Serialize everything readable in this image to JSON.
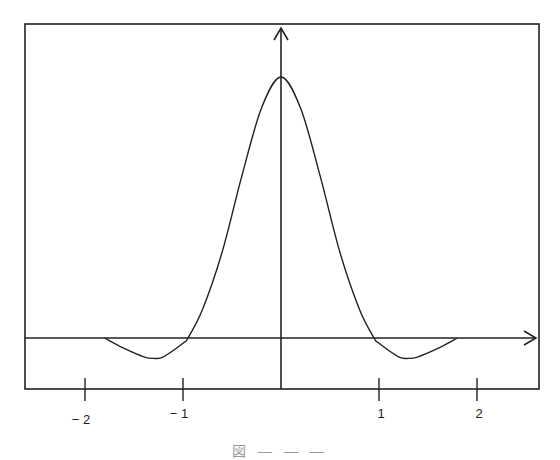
{
  "chart_data": {
    "type": "line",
    "title": "",
    "xlabel": "",
    "ylabel": "",
    "xlim": [
      -2.6,
      2.6
    ],
    "grid": false,
    "legend": null,
    "x_ticks": [
      -2,
      -1,
      1,
      2
    ],
    "x_tick_labels": [
      "− 2",
      "− 1",
      "1",
      "2"
    ],
    "series": [
      {
        "name": "curve",
        "x": [
          -1.8,
          -1.6,
          -1.4,
          -1.3,
          -1.2,
          -1.0,
          -0.95,
          -0.8,
          -0.6,
          -0.4,
          -0.2,
          0.0,
          0.2,
          0.4,
          0.6,
          0.8,
          0.95,
          1.0,
          1.2,
          1.3,
          1.4,
          1.6,
          1.8
        ],
        "y": [
          0.0,
          -0.04,
          -0.072,
          -0.078,
          -0.072,
          -0.02,
          0.0,
          0.11,
          0.33,
          0.62,
          0.88,
          1.0,
          0.88,
          0.62,
          0.33,
          0.11,
          0.0,
          -0.02,
          -0.072,
          -0.078,
          -0.072,
          -0.04,
          0.0
        ]
      }
    ]
  },
  "caption": "図 — — —"
}
